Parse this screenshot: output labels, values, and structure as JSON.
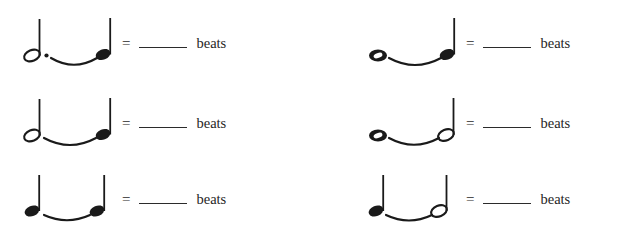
{
  "worksheet": {
    "title": "Tied note values worksheet",
    "equals_sign": "=",
    "unit_label": "beats",
    "blank_answer": "",
    "ink_color": "#1a1a1a",
    "background_color": "#ffffff",
    "columns": 2,
    "rows": 3
  },
  "problems": [
    {
      "id": "problem-1",
      "position": "top-left",
      "first_note": "dotted-half-note",
      "second_note": "quarter-note",
      "tie": "slur-tie",
      "equals": "=",
      "answer": "",
      "unit": "beats"
    },
    {
      "id": "problem-2",
      "position": "top-right",
      "first_note": "whole-note",
      "second_note": "quarter-note",
      "tie": "slur-tie",
      "equals": "=",
      "answer": "",
      "unit": "beats"
    },
    {
      "id": "problem-3",
      "position": "middle-left",
      "first_note": "half-note",
      "second_note": "quarter-note",
      "tie": "slur-tie",
      "equals": "=",
      "answer": "",
      "unit": "beats"
    },
    {
      "id": "problem-4",
      "position": "middle-right",
      "first_note": "whole-note",
      "second_note": "half-note",
      "tie": "slur-tie",
      "equals": "=",
      "answer": "",
      "unit": "beats"
    },
    {
      "id": "problem-5",
      "position": "bottom-left",
      "first_note": "quarter-note",
      "second_note": "quarter-note",
      "tie": "slur-tie",
      "equals": "=",
      "answer": "",
      "unit": "beats"
    },
    {
      "id": "problem-6",
      "position": "bottom-right",
      "first_note": "quarter-note",
      "second_note": "half-note",
      "tie": "slur-tie",
      "equals": "=",
      "answer": "",
      "unit": "beats"
    }
  ]
}
